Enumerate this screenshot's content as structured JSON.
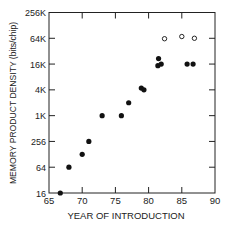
{
  "chart_data": {
    "type": "scatter",
    "title": "",
    "xlabel": "YEAR OF INTRODUCTION",
    "ylabel": "MEMORY PRODUCT DENSITY (bits/chip)",
    "xlim": [
      65,
      90
    ],
    "ylim": [
      16,
      262144
    ],
    "yscale": "log2",
    "xticks": [
      65,
      70,
      75,
      80,
      85,
      90
    ],
    "xtick_labels": [
      "65",
      "70",
      "75",
      "80",
      "85",
      "90"
    ],
    "yticks": [
      16,
      64,
      256,
      1024,
      4096,
      16384,
      65536,
      262144
    ],
    "ytick_labels": [
      "16",
      "64",
      "256",
      "1K",
      "4K",
      "16K",
      "64K",
      "256K"
    ],
    "grid": false,
    "legend": null,
    "series": [
      {
        "name": "filled",
        "marker": "filled-circle",
        "points": [
          {
            "x": 66.7,
            "y": 16
          },
          {
            "x": 68,
            "y": 64
          },
          {
            "x": 70,
            "y": 128
          },
          {
            "x": 71,
            "y": 256
          },
          {
            "x": 73,
            "y": 1024
          },
          {
            "x": 75.9,
            "y": 1024
          },
          {
            "x": 77,
            "y": 2048
          },
          {
            "x": 78.9,
            "y": 4500
          },
          {
            "x": 79.3,
            "y": 4096
          },
          {
            "x": 81.5,
            "y": 22000
          },
          {
            "x": 81.4,
            "y": 15000
          },
          {
            "x": 81.9,
            "y": 16384
          },
          {
            "x": 85.8,
            "y": 16384
          },
          {
            "x": 86.7,
            "y": 16384
          }
        ]
      },
      {
        "name": "open",
        "marker": "open-circle",
        "points": [
          {
            "x": 82.4,
            "y": 64000
          },
          {
            "x": 85,
            "y": 72000
          },
          {
            "x": 86.9,
            "y": 65536
          }
        ]
      }
    ]
  }
}
